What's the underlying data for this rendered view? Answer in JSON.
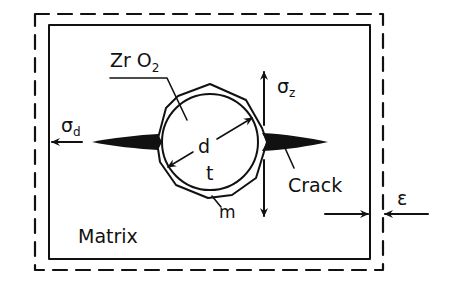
{
  "diagram": {
    "title": "",
    "labels": {
      "particle_material_main": "Zr O",
      "particle_material_sub": "2",
      "sigma_d_main": "σ",
      "sigma_d_sub": "d",
      "sigma_z_main": "σ",
      "sigma_z_sub": "z",
      "diameter": "d",
      "tetragonal": "t",
      "monoclinic": "m",
      "crack": "Crack",
      "matrix": "Matrix",
      "strain": "ε"
    },
    "elements": {
      "outer_boundary": "dashed rectangle (strained matrix boundary)",
      "inner_boundary": "solid rectangle (matrix)",
      "particle": "circle with surrounding transformed polygon shell",
      "cracks": "two black wedge-shaped cracks extending left and right from particle",
      "arrows": [
        "sigma_d leftwards",
        "sigma_z vertical double-headed",
        "epsilon converging arrows",
        "diameter double-headed arrow"
      ]
    },
    "colors": {
      "ink": "#111111",
      "background": "#ffffff"
    }
  }
}
